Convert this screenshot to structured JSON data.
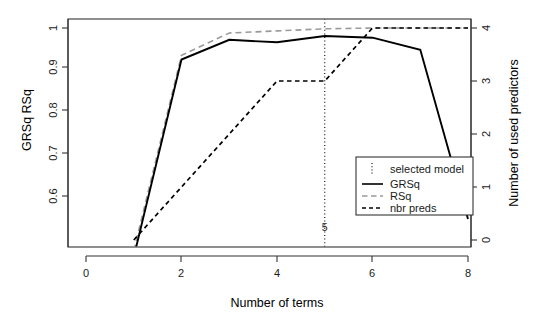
{
  "chart_data": {
    "type": "line",
    "title": "",
    "xlabel": "Number of terms",
    "ylabel_left": "GRSq  RSq",
    "ylabel_right": "Number of used predictors",
    "grid": false,
    "xlim": [
      -0.2,
      8.4
    ],
    "xticks": [
      0,
      2,
      4,
      6,
      8
    ],
    "xtick_labels": [
      "0",
      "2",
      "4",
      "6",
      "8"
    ],
    "ylim_left": [
      0.52,
      1.02
    ],
    "yticks_left": [
      0.6,
      0.7,
      0.8,
      0.9,
      1.0
    ],
    "ytick_labels_left": [
      "0.6",
      "0.7",
      "0.8",
      "0.9",
      "1"
    ],
    "ylim_right": [
      -0.2,
      4.2
    ],
    "yticks_right": [
      0,
      1,
      2,
      3,
      4
    ],
    "ytick_labels_right": [
      "0",
      "1",
      "2",
      "3",
      "4"
    ],
    "legend_position": "bottom-right",
    "annotations": [
      {
        "name": "selected-model-vline",
        "x": 5,
        "label": "5",
        "style": "dotted"
      }
    ],
    "series": [
      {
        "name": "GRSq",
        "axis": "left",
        "style": "solid",
        "color": "#000000",
        "x": [
          1,
          2,
          3,
          4,
          5,
          6,
          7,
          8
        ],
        "y": [
          0.455,
          0.925,
          0.972,
          0.966,
          0.981,
          0.977,
          0.948,
          0.545
        ]
      },
      {
        "name": "RSq",
        "axis": "left",
        "style": "dashed",
        "color": "#9a9a9a",
        "x": [
          1,
          2,
          3,
          4,
          5,
          6,
          7,
          8
        ],
        "y": [
          0.47,
          0.935,
          0.988,
          0.993,
          0.998,
          1.0,
          1.0,
          1.0
        ]
      },
      {
        "name": "nbr preds",
        "axis": "right",
        "style": "dashed",
        "color": "#000000",
        "x": [
          1,
          2,
          3,
          4,
          5,
          6,
          7,
          8
        ],
        "y": [
          0,
          1,
          2,
          3,
          3,
          4,
          4,
          4
        ]
      }
    ]
  },
  "axes": {
    "x_title": "Number of terms",
    "y_left_title": "GRSq  RSq",
    "y_right_title": "Number of used predictors",
    "x_ticks": [
      "0",
      "2",
      "4",
      "6",
      "8"
    ],
    "y_left_ticks": [
      "1",
      "0.9",
      "0.8",
      "0.7",
      "0.6"
    ],
    "y_right_ticks": [
      "4",
      "3",
      "2",
      "1",
      "0"
    ]
  },
  "legend": {
    "items": [
      {
        "label": "selected model",
        "style": "dotted-vertical",
        "color": "#000000"
      },
      {
        "label": "GRSq",
        "style": "solid",
        "color": "#000000"
      },
      {
        "label": "RSq",
        "style": "dashed-long",
        "color": "#9a9a9a"
      },
      {
        "label": "nbr preds",
        "style": "dashed-short",
        "color": "#000000"
      }
    ]
  },
  "vline": {
    "label": "5"
  }
}
